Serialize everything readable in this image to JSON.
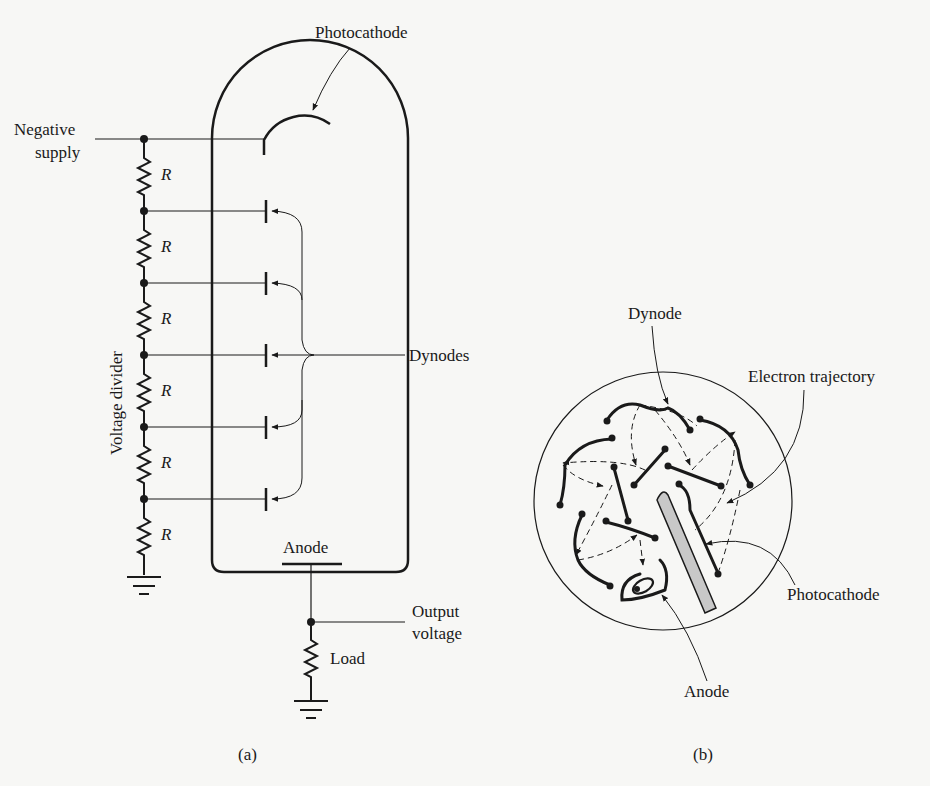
{
  "figure_a": {
    "caption": "(a)",
    "labels": {
      "photocathode": "Photocathode",
      "negative_supply_line1": "Negative",
      "negative_supply_line2": "supply",
      "voltage_divider": "Voltage divider",
      "dynodes": "Dynodes",
      "anode": "Anode",
      "output_voltage_line1": "Output",
      "output_voltage_line2": "voltage",
      "load": "Load"
    },
    "resistors": [
      {
        "label": "R"
      },
      {
        "label": "R"
      },
      {
        "label": "R"
      },
      {
        "label": "R"
      },
      {
        "label": "R"
      },
      {
        "label": "R"
      }
    ],
    "dynode_count": 5
  },
  "figure_b": {
    "caption": "(b)",
    "labels": {
      "dynode": "Dynode",
      "electron_trajectory": "Electron trajectory",
      "photocathode": "Photocathode",
      "anode": "Anode"
    }
  },
  "colors": {
    "ink": "#1a1a1a",
    "background": "#f7f7f5",
    "photocathode_fill": "#c8c8c8"
  }
}
